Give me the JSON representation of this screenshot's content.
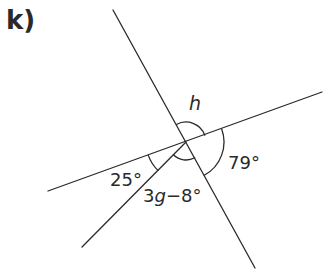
{
  "question": {
    "label": "k)"
  },
  "diagram": {
    "type": "angles at a point",
    "center": [
      186,
      142
    ],
    "lines": [
      {
        "name": "steep-line",
        "from": [
          113,
          10
        ],
        "to": [
          255,
          268
        ]
      },
      {
        "name": "shallow-line",
        "from": [
          48,
          191
        ],
        "to": [
          322,
          92
        ]
      },
      {
        "name": "third-ray",
        "from": [
          186,
          142
        ],
        "to": [
          82,
          247
        ]
      }
    ],
    "angles": [
      {
        "name": "angle-h",
        "label": "h"
      },
      {
        "name": "angle-79",
        "label": "79°"
      },
      {
        "name": "angle-25",
        "label": "25°"
      },
      {
        "name": "angle-3g-8",
        "label": "3g−8°",
        "expr_var": "g",
        "expr_prefix": "3",
        "expr_suffix": "−8°"
      }
    ],
    "stroke_color": "#2a2a2a"
  }
}
